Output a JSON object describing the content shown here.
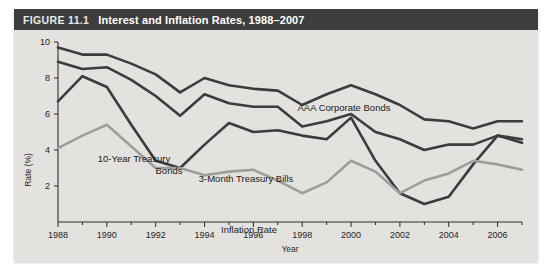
{
  "figure": {
    "number_label": "FIGURE 11.1",
    "title": "Interest and Inflation Rates, 1988–2007",
    "panel_bg": "#e3e2de",
    "title_bar_bg": "#3d3d3d",
    "title_bar_fg": "#ffffff"
  },
  "chart_data": {
    "type": "line",
    "title": "Interest and Inflation Rates, 1988–2007",
    "xlabel": "Year",
    "ylabel": "Rate (%)",
    "xlim": [
      1988,
      2007
    ],
    "ylim": [
      0,
      10
    ],
    "yticks": [
      2,
      4,
      6,
      8,
      10
    ],
    "ytick_labels": [
      "2",
      "4",
      "6",
      "8",
      "10"
    ],
    "xticks": [
      1988,
      1990,
      1992,
      1994,
      1996,
      1998,
      2000,
      2002,
      2004,
      2006
    ],
    "xtick_labels": [
      "1988",
      "1990",
      "1992",
      "1994",
      "1996",
      "1998",
      "2000",
      "2002",
      "2004",
      "2006"
    ],
    "x_minor_ticks": [
      1989,
      1991,
      1993,
      1995,
      1997,
      1999,
      2001,
      2003,
      2005,
      2007
    ],
    "grid": false,
    "legend": "inline-annotations",
    "legend_position": "inline",
    "x": [
      1988,
      1989,
      1990,
      1991,
      1992,
      1993,
      1994,
      1995,
      1996,
      1997,
      1998,
      1999,
      2000,
      2001,
      2002,
      2003,
      2004,
      2005,
      2006,
      2007
    ],
    "series": [
      {
        "name": "AAA Corporate Bonds",
        "color": "#3c3c3c",
        "width": 2.6,
        "values": [
          9.7,
          9.3,
          9.3,
          8.8,
          8.2,
          7.2,
          8.0,
          7.6,
          7.4,
          7.3,
          6.5,
          7.1,
          7.6,
          7.1,
          6.5,
          5.7,
          5.6,
          5.2,
          5.6,
          5.6
        ]
      },
      {
        "name": "10-Year Treasury Bonds",
        "color": "#3c3c3c",
        "width": 2.6,
        "values": [
          8.9,
          8.5,
          8.6,
          7.9,
          7.0,
          5.9,
          7.1,
          6.6,
          6.4,
          6.4,
          5.3,
          5.6,
          6.0,
          5.0,
          4.6,
          4.0,
          4.3,
          4.3,
          4.8,
          4.6
        ]
      },
      {
        "name": "3-Month Treasury Bills",
        "color": "#3c3c3c",
        "width": 2.6,
        "values": [
          6.7,
          8.1,
          7.5,
          5.4,
          3.4,
          3.0,
          4.3,
          5.5,
          5.0,
          5.1,
          4.8,
          4.6,
          5.8,
          3.4,
          1.6,
          1.0,
          1.4,
          3.2,
          4.8,
          4.4
        ]
      },
      {
        "name": "Inflation Rate",
        "color": "#9d9d9b",
        "width": 2.6,
        "values": [
          4.1,
          4.8,
          5.4,
          4.2,
          3.0,
          3.0,
          2.6,
          2.8,
          2.9,
          2.3,
          1.6,
          2.2,
          3.4,
          2.8,
          1.6,
          2.3,
          2.7,
          3.4,
          3.2,
          2.9
        ]
      }
    ],
    "annotations": [
      {
        "text": "AAA Corporate Bonds",
        "x_px": 330,
        "y_px": 81
      },
      {
        "text": "10-Year Treasury",
        "x_px": 120,
        "y_px": 132
      },
      {
        "text": "Bonds",
        "x_px": 155,
        "y_px": 144
      },
      {
        "text": "3-Month Treasury Bills",
        "x_px": 232,
        "y_px": 152
      },
      {
        "text": "Inflation Rate",
        "x_px": 235,
        "y_px": 203
      }
    ]
  }
}
